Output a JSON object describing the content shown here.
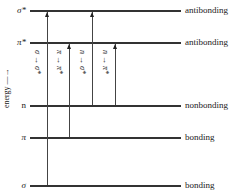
{
  "diagram": {
    "axis_label": "energy —→",
    "levels": [
      {
        "symbol": "σ*",
        "type": "antibonding",
        "y": 11
      },
      {
        "symbol": "π*",
        "type": "antibonding",
        "y": 43
      },
      {
        "symbol": "n",
        "type": "nonbonding",
        "y": 106
      },
      {
        "symbol": "π",
        "type": "bonding",
        "y": 138
      },
      {
        "symbol": "σ",
        "type": "bonding",
        "y": 186
      }
    ],
    "transitions": [
      {
        "label": "σ → σ*",
        "from": "σ",
        "to": "σ*"
      },
      {
        "label": "π → π*",
        "from": "π",
        "to": "π*"
      },
      {
        "label": "n → σ*",
        "from": "n",
        "to": "σ*"
      },
      {
        "label": "n → π*",
        "from": "n",
        "to": "π*"
      }
    ]
  }
}
